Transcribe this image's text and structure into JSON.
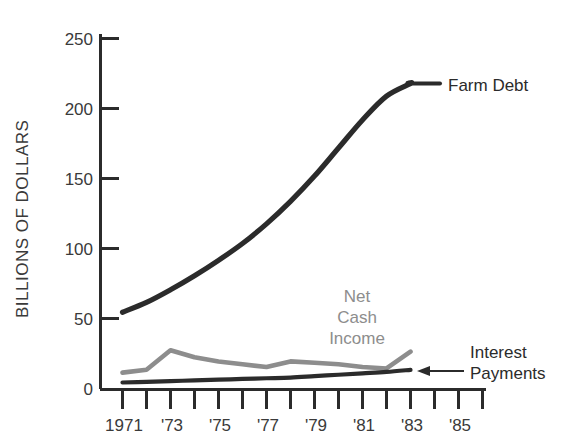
{
  "chart_data": {
    "type": "line",
    "title": "",
    "xlabel": "",
    "ylabel": "BILLIONS OF DOLLARS",
    "xlim": [
      1970.5,
      1986.5
    ],
    "ylim": [
      0,
      250
    ],
    "grid": false,
    "legend_position": "inline-labels",
    "y_ticks": [
      0,
      50,
      100,
      150,
      200,
      250
    ],
    "y_tick_labels": [
      "0",
      "50",
      "100",
      "150",
      "200",
      "250"
    ],
    "x_ticks": [
      1971,
      1972,
      1973,
      1974,
      1975,
      1976,
      1977,
      1978,
      1979,
      1980,
      1981,
      1982,
      1983,
      1984,
      1985,
      1986
    ],
    "x_tick_labels": [
      "1971",
      "",
      "'73",
      "",
      "'75",
      "",
      "'77",
      "",
      "'79",
      "",
      "'81",
      "",
      "'83",
      "",
      "'85",
      ""
    ],
    "x": [
      1971,
      1972,
      1973,
      1974,
      1975,
      1976,
      1977,
      1978,
      1979,
      1980,
      1981,
      1982,
      1983
    ],
    "series": [
      {
        "name": "Farm Debt",
        "color": "#2b2b2b",
        "values": [
          55,
          62,
          71,
          81,
          92,
          104,
          118,
          134,
          152,
          172,
          192,
          209,
          218
        ]
      },
      {
        "name": "Net Cash Income",
        "color": "#8d8d8d",
        "values": [
          12,
          14,
          28,
          23,
          20,
          18,
          16,
          20,
          19,
          18,
          16,
          15,
          27
        ]
      },
      {
        "name": "Interest Payments",
        "color": "#2b2b2b",
        "values": [
          5,
          5.5,
          6,
          6.5,
          7,
          7.5,
          8,
          8.5,
          9.5,
          10.5,
          11.5,
          12.5,
          14
        ]
      }
    ],
    "annotations": [
      {
        "name": "farm-debt-label",
        "text": "Farm Debt",
        "color": "#2b2b2b"
      },
      {
        "name": "net-cash-income-label",
        "text": [
          "Net",
          "Cash",
          "Income"
        ],
        "color": "#8d8d8d"
      },
      {
        "name": "interest-payments-label",
        "text": [
          "Interest",
          "Payments"
        ],
        "color": "#2b2b2b",
        "arrow": true
      }
    ]
  },
  "axis": {
    "y_title": "BILLIONS OF DOLLARS",
    "y_labels": [
      "250",
      "200",
      "150",
      "100",
      "50",
      "0"
    ],
    "x_labels": [
      "1971",
      "'73",
      "'75",
      "'77",
      "'79",
      "'81",
      "'83",
      "'85"
    ]
  },
  "labels": {
    "farm_debt": "Farm Debt",
    "net_cash_line1": "Net",
    "net_cash_line2": "Cash",
    "net_cash_line3": "Income",
    "interest_line1": "Interest",
    "interest_line2": "Payments"
  },
  "colors": {
    "dark": "#2b2b2b",
    "gray": "#8d8d8d",
    "text": "#3a3a3a",
    "background": "#ffffff"
  }
}
